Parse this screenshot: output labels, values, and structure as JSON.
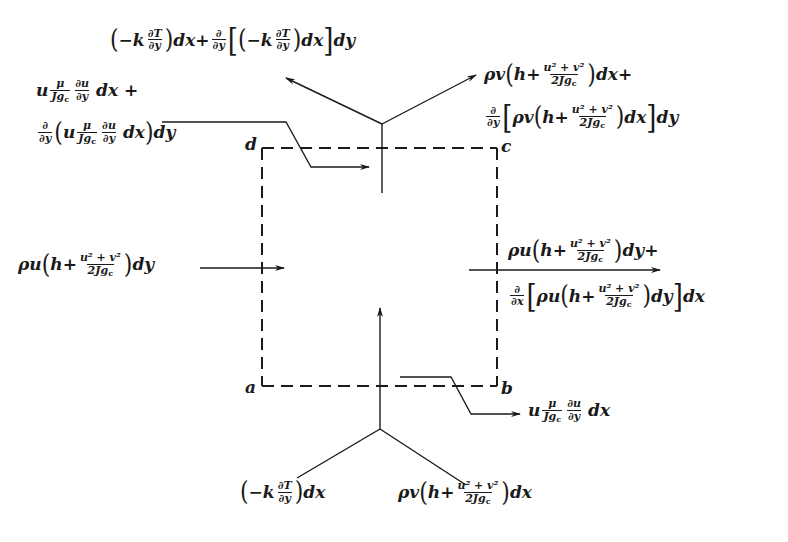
{
  "figure": {
    "corners": {
      "a": "a",
      "b": "b",
      "c": "c",
      "d": "d"
    },
    "colors": {
      "ink": "#1a1a1a",
      "background": "#ffffff"
    }
  },
  "labels": {
    "top_conduction": {
      "text": "(−k ∂T/∂y) dx + ∂/∂y [(−k ∂T/∂y) dx] dy",
      "t1": "−k",
      "t2": "dx+",
      "t3": "dx",
      "t4": "dy",
      "dT": "∂T",
      "dy": "∂y",
      "d": "∂"
    },
    "top_shear": {
      "text": "u μ/Jgc ∂u/∂y dx + ∂/∂y (u μ/Jgc ∂u/∂y dx) dy",
      "u": "u",
      "mu": "μ",
      "J": "J",
      "g": "g",
      "c": "c",
      "du": "∂u",
      "dy": "∂y",
      "dxplus": "dx +",
      "dx": "dx",
      "dyend": "dy",
      "d": "∂"
    },
    "top_convection": {
      "text": "ρv(h + (u²+v²)/2Jgc) dx + ∂/∂y [ρv(h + (u²+v²)/2Jgc) dx] dy",
      "rhov": "ρv",
      "h": "h+",
      "num": "u² + v²",
      "den": "2J",
      "g": "g",
      "c": "c",
      "dxplus": "dx+",
      "dx": "dx",
      "dy": "dy",
      "d": "∂",
      "dyv": "∂y"
    },
    "left_convection": {
      "text": "ρu(h + (u²+v²)/2Jgc) dy",
      "rhou": "ρu",
      "h": "h+",
      "num": "u² + v²",
      "den": "2J",
      "g": "g",
      "c": "c",
      "dy": "dy"
    },
    "right_convection": {
      "text": "ρu(h + (u²+v²)/2Jgc) dy + ∂/∂x [ρu(h + (u²+v²)/2Jgc) dy] dx",
      "rhou": "ρu",
      "h": "h+",
      "num": "u² + v²",
      "den": "2J",
      "g": "g",
      "c": "c",
      "dyplus": "dy+",
      "dy": "dy",
      "dx": "dx",
      "d": "∂",
      "dxv": "∂x"
    },
    "bottom_shear": {
      "text": "u μ/Jgc ∂u/∂y dx",
      "u": "u",
      "mu": "μ",
      "J": "J",
      "g": "g",
      "c": "c",
      "du": "∂u",
      "dy": "∂y",
      "dx": "dx"
    },
    "bottom_conduction": {
      "text": "(−k ∂T/∂y) dx",
      "k": "−k",
      "dT": "∂T",
      "dy": "∂y",
      "dx": "dx"
    },
    "bottom_convection": {
      "text": "ρv(h + (u²+v²)/2Jgc) dx",
      "rhov": "ρv",
      "h": "h+",
      "num": "u² + v²",
      "den": "2J",
      "g": "g",
      "c": "c",
      "dx": "dx"
    }
  }
}
